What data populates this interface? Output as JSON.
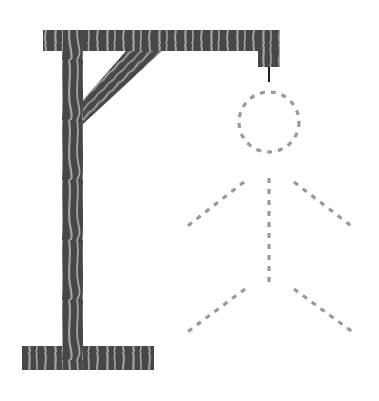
{
  "game": {
    "name": "Hangman",
    "wrong_guesses": 0,
    "max_wrong_guesses": 6
  },
  "colors": {
    "wood_dark": "#474747",
    "wood_light": "#a3a3a3",
    "rope": "#1e1e1e",
    "figure_outline": "#9a9a9a",
    "background": "#ffffff"
  },
  "figure_parts": [
    {
      "id": "head",
      "visible": false,
      "style": "dashed"
    },
    {
      "id": "body",
      "visible": false,
      "style": "dashed"
    },
    {
      "id": "left-arm",
      "visible": false,
      "style": "dashed"
    },
    {
      "id": "right-arm",
      "visible": false,
      "style": "dashed"
    },
    {
      "id": "left-leg",
      "visible": false,
      "style": "dashed"
    },
    {
      "id": "right-leg",
      "visible": false,
      "style": "dashed"
    }
  ]
}
